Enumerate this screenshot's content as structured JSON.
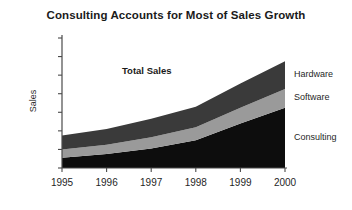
{
  "chart_data": {
    "type": "area",
    "title": "Consulting Accounts for Most of Sales Growth",
    "xlabel": "",
    "ylabel": "Sales",
    "stacked": true,
    "grid": false,
    "legend_position": "right-of-plot-inline",
    "categories": [
      "1995",
      "1996",
      "1997",
      "1998",
      "1999",
      "2000"
    ],
    "x": [
      1995,
      1996,
      1997,
      1998,
      1999,
      2000
    ],
    "ylim": [
      0,
      7
    ],
    "yticks": [
      0,
      1,
      2,
      3,
      4,
      5,
      6,
      7
    ],
    "ytick_labels": [
      "",
      "",
      "",
      "",
      "",
      "",
      "",
      ""
    ],
    "series": [
      {
        "name": "Consulting",
        "color": "#0d0d0d",
        "values": [
          0.55,
          0.75,
          1.05,
          1.5,
          2.4,
          3.25
        ]
      },
      {
        "name": "Software",
        "color": "#9a9a9a",
        "values": [
          0.45,
          0.5,
          0.6,
          0.7,
          0.85,
          1.0
        ]
      },
      {
        "name": "Hardware",
        "color": "#3a3a3a",
        "values": [
          0.75,
          0.85,
          1.0,
          1.1,
          1.3,
          1.5
        ]
      }
    ],
    "cumulative_totals": [
      1.75,
      2.1,
      2.65,
      3.3,
      4.55,
      5.75
    ],
    "annotations": [
      {
        "text": "Total Sales",
        "x": 1996.9,
        "y": 5.2
      }
    ]
  },
  "axis": {
    "y_axis_label": "Sales",
    "tick_count": 8
  },
  "series_labels": [
    {
      "label": "Hardware"
    },
    {
      "label": "Software"
    },
    {
      "label": "Consulting"
    }
  ],
  "annotation": {
    "total_sales": "Total Sales"
  },
  "xtick_labels": [
    "1995",
    "1996",
    "1997",
    "1998",
    "1999",
    "2000"
  ]
}
